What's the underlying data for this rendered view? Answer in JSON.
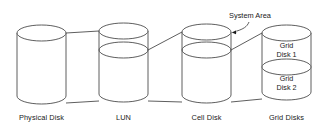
{
  "diagram": {
    "type": "storage-layer-cylinder-diagram",
    "background_color": "#ffffff",
    "line_color": "#4c4c4c",
    "text_color": "#1a1a1a",
    "callout": {
      "label": "System Area",
      "points_to": "cell-disk-system-area"
    },
    "cylinders": [
      {
        "id": "physical-disk",
        "caption": "Physical Disk",
        "has_divider": false,
        "inner_labels": []
      },
      {
        "id": "lun",
        "caption": "LUN",
        "has_divider": true,
        "inner_labels": []
      },
      {
        "id": "cell-disk",
        "caption": "Cell Disk",
        "has_divider": true,
        "inner_labels": []
      },
      {
        "id": "grid-disks",
        "caption": "Grid Disks",
        "has_divider": true,
        "inner_labels": [
          "Grid Disk 1",
          "Grid Disk 2"
        ]
      }
    ],
    "captions": {
      "physical_disk": "Physical Disk",
      "lun": "LUN",
      "cell_disk": "Cell Disk",
      "grid_disks": "Grid Disks"
    },
    "grid_disk_1": {
      "line1": "Grid",
      "line2": "Disk 1"
    },
    "grid_disk_2": {
      "line1": "Grid",
      "line2": "Disk 2"
    }
  }
}
